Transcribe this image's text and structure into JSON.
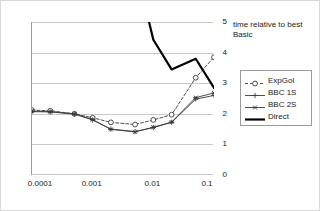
{
  "chart_data": {
    "type": "line",
    "title": "time relative to best Basic",
    "xlabel": "",
    "ylabel": "",
    "xscale": "log",
    "xlim": [
      0.0001,
      0.1
    ],
    "ylim": [
      0,
      5
    ],
    "grid": true,
    "y_axis_side": "right",
    "legend_position": "right",
    "x_ticks": [
      {
        "value": 0.0001,
        "label": "0.0001"
      },
      {
        "value": 0.001,
        "label": "0.001"
      },
      {
        "value": 0.01,
        "label": "0.01"
      },
      {
        "value": 0.1,
        "label": "0.1"
      }
    ],
    "y_ticks": [
      {
        "value": 0,
        "label": "0"
      },
      {
        "value": 1,
        "label": "1"
      },
      {
        "value": 2,
        "label": "2"
      },
      {
        "value": 3,
        "label": "3"
      },
      {
        "value": 4,
        "label": "4"
      },
      {
        "value": 5,
        "label": "5"
      }
    ],
    "series": [
      {
        "name": "ExpGol",
        "style": "dashed",
        "marker": "circle",
        "color": "#3a3a3a",
        "x": [
          0.0001,
          0.0002,
          0.0005,
          0.001,
          0.002,
          0.005,
          0.01,
          0.02,
          0.05,
          0.1
        ],
        "values": [
          2.12,
          2.1,
          2.0,
          1.87,
          1.72,
          1.65,
          1.8,
          1.97,
          3.18,
          3.85
        ]
      },
      {
        "name": "BBC 1S",
        "style": "solid",
        "marker": "plus",
        "color": "#3a3a3a",
        "x": [
          0.0001,
          0.0002,
          0.0005,
          0.001,
          0.002,
          0.005,
          0.01,
          0.02,
          0.05,
          0.1
        ],
        "values": [
          2.07,
          2.06,
          1.99,
          1.8,
          1.5,
          1.42,
          1.55,
          1.72,
          2.48,
          2.6
        ]
      },
      {
        "name": "BBC 2S",
        "style": "solid",
        "marker": "star",
        "color": "#3a3a3a",
        "x": [
          0.0001,
          0.0002,
          0.0005,
          0.001,
          0.002,
          0.005,
          0.01,
          0.02,
          0.05,
          0.1
        ],
        "values": [
          2.09,
          2.07,
          2.0,
          1.81,
          1.49,
          1.41,
          1.56,
          1.73,
          2.53,
          2.68
        ]
      },
      {
        "name": "Direct",
        "style": "thick-solid",
        "marker": "none",
        "color": "#000000",
        "clipped_above_top": true,
        "x": [
          0.0085,
          0.01,
          0.02,
          0.05,
          0.1
        ],
        "values": [
          5.0,
          4.42,
          3.45,
          3.8,
          2.85
        ]
      }
    ]
  },
  "legend": {
    "items": [
      {
        "label": "ExpGol"
      },
      {
        "label": "BBC 1S"
      },
      {
        "label": "BBC 2S"
      },
      {
        "label": "Direct"
      }
    ]
  }
}
